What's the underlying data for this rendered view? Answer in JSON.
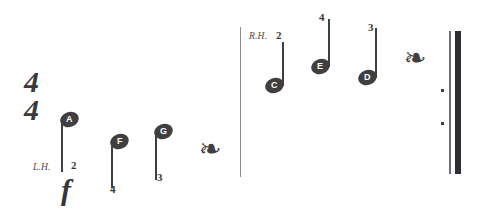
{
  "score": {
    "background_color": "#ffffff",
    "ink_color": "#3f3f42",
    "time_signature": {
      "numerator": "4",
      "denominator": "4"
    },
    "dynamic": {
      "symbol": "f",
      "name": "forte"
    },
    "sections": [
      {
        "hand_label": "L.H.",
        "notes": [
          {
            "letter": "A",
            "fingering": "2",
            "stem": "down"
          },
          {
            "letter": "F",
            "fingering": "4",
            "stem": "down"
          },
          {
            "letter": "G",
            "fingering": "3",
            "stem": "down"
          }
        ],
        "rest": {
          "type": "quarter-rest",
          "glyph": "❧"
        }
      },
      {
        "hand_label": "R.H.",
        "notes": [
          {
            "letter": "C",
            "fingering": "2",
            "stem": "up"
          },
          {
            "letter": "E",
            "fingering": "4",
            "stem": "up"
          },
          {
            "letter": "D",
            "fingering": "3",
            "stem": "up"
          }
        ],
        "rest": {
          "type": "quarter-rest",
          "glyph": "❧"
        }
      }
    ],
    "ending": {
      "type": "final-repeat-barline",
      "dots": 2
    }
  }
}
